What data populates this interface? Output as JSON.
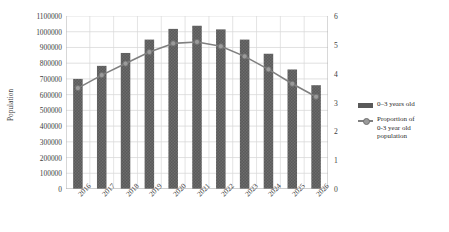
{
  "chart_data": {
    "type": "bar",
    "title": "",
    "subtitle": "",
    "categories": [
      "2016",
      "2017",
      "2018",
      "2019",
      "2020",
      "2021",
      "2022",
      "2023",
      "2024",
      "2025",
      "2026"
    ],
    "series": [
      {
        "name": "0–3 years old",
        "type": "bar",
        "axis": "left",
        "values": [
          700000,
          783000,
          865000,
          950000,
          1018000,
          1038000,
          1015000,
          950000,
          860000,
          760000,
          660000
        ]
      },
      {
        "name": "Proportion of 0-3 year old population",
        "type": "line",
        "axis": "right",
        "values": [
          3.5,
          3.95,
          4.35,
          4.75,
          5.05,
          5.1,
          4.95,
          4.6,
          4.15,
          3.65,
          3.2
        ]
      }
    ],
    "xlabel": "",
    "ylabel": "Population",
    "y2label": "",
    "ylim": [
      0,
      1100000
    ],
    "y2lim": [
      0,
      6
    ],
    "yticks": [
      "0",
      "100000",
      "200000",
      "300000",
      "400000",
      "500000",
      "600000",
      "700000",
      "800000",
      "900000",
      "1000000",
      "1100000"
    ],
    "y2ticks": [
      "0",
      "1",
      "2",
      "3",
      "4",
      "5",
      "6"
    ],
    "grid": true,
    "legend_position": "right",
    "colors": {
      "bar": "#595959",
      "line": "#808080",
      "marker": "#9a9a9a",
      "grid": "#d9d9d9",
      "text": "#3d3d3d",
      "background": "#ffffff"
    }
  },
  "legend": {
    "items": [
      {
        "label": "0–3 years old",
        "lines": [
          "0–3 years old"
        ],
        "marker": "bar-swatch"
      },
      {
        "label": "Proportion of 0-3 year old population",
        "lines": [
          "Proportion of",
          "0-3 year old",
          "population"
        ],
        "marker": "line-swatch"
      }
    ]
  },
  "axis": {
    "y_title": "Population"
  }
}
